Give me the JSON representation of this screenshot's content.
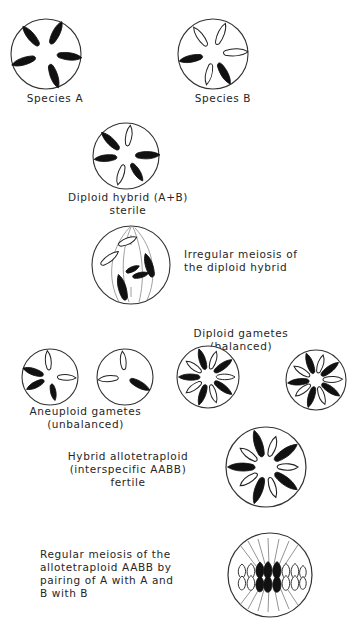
{
  "figure": {
    "title_visible": false,
    "colors": {
      "ink": "#1a1a1a",
      "outline": "#333333",
      "background": "#ffffff",
      "chromosome_dark": "#111111",
      "chromosome_light": "#ffffff"
    }
  },
  "labels": {
    "species_a": "Species A",
    "species_b": "Species B",
    "diploid_hybrid": "Diploid hybrid (A+B)\nsterile",
    "irregular_meiosis": "Irregular meiosis of\nthe diploid hybrid",
    "diploid_gametes": "Diploid gametes\n(balanced)",
    "aneuploid_gametes": "Aneuploid  gametes\n(unbalanced)",
    "hybrid_allotetraploid": "Hybrid allotetraploid\n(interspecific  AABB)\nfertile",
    "regular_meiosis": "Regular meiosis of the\nallotetraploid AABB by\npairing of  A with A and\nB with B"
  },
  "cells": {
    "species_a": {
      "name": "species-a-cell",
      "chromosome_count": 5,
      "dark_count": 5,
      "light_count": 0,
      "chromosomes": [
        {
          "angle": -108,
          "shade": "dark",
          "length": 26,
          "width": 7
        },
        {
          "angle": -40,
          "shade": "dark",
          "length": 26,
          "width": 7
        },
        {
          "angle": 26,
          "shade": "dark",
          "length": 26,
          "width": 7
        },
        {
          "angle": 96,
          "shade": "dark",
          "length": 26,
          "width": 7
        },
        {
          "angle": 160,
          "shade": "dark",
          "length": 26,
          "width": 7
        }
      ]
    },
    "species_b": {
      "name": "species-b-cell",
      "chromosome_count": 5,
      "dark_count": 2,
      "light_count": 3,
      "chromosomes": [
        {
          "angle": -102,
          "shade": "dark",
          "length": 25,
          "width": 7
        },
        {
          "angle": -36,
          "shade": "light",
          "length": 23,
          "width": 7
        },
        {
          "angle": 22,
          "shade": "light",
          "length": 23,
          "width": 7
        },
        {
          "angle": 86,
          "shade": "light",
          "length": 24,
          "width": 8
        },
        {
          "angle": 150,
          "shade": "dark",
          "length": 25,
          "width": 7
        },
        {
          "angle": 186,
          "shade": "light",
          "length": 22,
          "width": 6
        }
      ]
    },
    "diploid_hybrid": {
      "name": "diploid-hybrid-cell",
      "chromosome_count": 6,
      "dark_count": 4,
      "light_count": 2,
      "chromosomes": [
        {
          "angle": -96,
          "shade": "dark",
          "length": 24,
          "width": 7
        },
        {
          "angle": -46,
          "shade": "dark",
          "length": 26,
          "width": 7
        },
        {
          "angle": 8,
          "shade": "light",
          "length": 22,
          "width": 6
        },
        {
          "angle": 88,
          "shade": "dark",
          "length": 26,
          "width": 8
        },
        {
          "angle": 146,
          "shade": "dark",
          "length": 22,
          "width": 7
        },
        {
          "angle": 196,
          "shade": "light",
          "length": 22,
          "width": 6
        }
      ]
    },
    "irregular_meiosis": {
      "name": "irregular-meiosis-cell",
      "has_spindle": true,
      "chromosome_count": 6,
      "chromosomes": [
        {
          "x": -4,
          "y": -22,
          "angle": 70,
          "shade": "light",
          "length": 19,
          "width": 7
        },
        {
          "x": -20,
          "y": -6,
          "angle": 55,
          "shade": "light",
          "length": 21,
          "width": 7
        },
        {
          "x": 17,
          "y": 1,
          "angle": -20,
          "shade": "dark",
          "length": 24,
          "width": 8
        },
        {
          "x": 3,
          "y": 4,
          "angle": 65,
          "shade": "dark",
          "length": 14,
          "width": 6
        },
        {
          "x": 10,
          "y": 9,
          "angle": 78,
          "shade": "dark",
          "length": 16,
          "width": 7
        },
        {
          "x": -8,
          "y": 22,
          "angle": -18,
          "shade": "dark",
          "length": 26,
          "width": 8
        }
      ]
    },
    "aneuploid_gamete_1": {
      "name": "aneuploid-gamete-1",
      "chromosome_count": 4,
      "dark_count": 3,
      "light_count": 1,
      "chromosomes": [
        {
          "angle": -118,
          "shade": "dark",
          "length": 21,
          "width": 7
        },
        {
          "angle": -72,
          "shade": "dark",
          "length": 23,
          "width": 8
        },
        {
          "angle": -6,
          "shade": "light",
          "length": 21,
          "width": 7
        },
        {
          "angle": 92,
          "shade": "light",
          "length": 20,
          "width": 7
        },
        {
          "angle": 168,
          "shade": "dark",
          "length": 18,
          "width": 7
        }
      ]
    },
    "aneuploid_gamete_2": {
      "name": "aneuploid-gamete-2",
      "chromosome_count": 3,
      "dark_count": 1,
      "light_count": 2,
      "chromosomes": [
        {
          "angle": -96,
          "shade": "light",
          "length": 22,
          "width": 7
        },
        {
          "angle": -6,
          "shade": "light",
          "length": 20,
          "width": 7
        },
        {
          "angle": 120,
          "shade": "dark",
          "length": 24,
          "width": 8
        }
      ]
    },
    "diploid_gamete_1": {
      "name": "diploid-gamete-1",
      "chromosome_count": 10,
      "dark_count": 5,
      "light_count": 5,
      "chromosomes": [
        {
          "angle": -90,
          "shade": "dark",
          "length": 24,
          "width": 7
        },
        {
          "angle": -54,
          "shade": "light",
          "length": 21,
          "width": 7
        },
        {
          "angle": -18,
          "shade": "dark",
          "length": 24,
          "width": 7
        },
        {
          "angle": 18,
          "shade": "light",
          "length": 21,
          "width": 7
        },
        {
          "angle": 54,
          "shade": "dark",
          "length": 24,
          "width": 7
        },
        {
          "angle": 90,
          "shade": "light",
          "length": 21,
          "width": 7
        },
        {
          "angle": 126,
          "shade": "dark",
          "length": 24,
          "width": 7
        },
        {
          "angle": 162,
          "shade": "light",
          "length": 21,
          "width": 7
        },
        {
          "angle": 198,
          "shade": "dark",
          "length": 24,
          "width": 7
        },
        {
          "angle": 234,
          "shade": "light",
          "length": 21,
          "width": 7
        }
      ]
    },
    "diploid_gamete_2": {
      "name": "diploid-gamete-2",
      "chromosome_count": 10,
      "dark_count": 5,
      "light_count": 5,
      "chromosomes": [
        {
          "angle": -96,
          "shade": "dark",
          "length": 24,
          "width": 7
        },
        {
          "angle": -58,
          "shade": "light",
          "length": 21,
          "width": 7
        },
        {
          "angle": -20,
          "shade": "dark",
          "length": 24,
          "width": 7
        },
        {
          "angle": 16,
          "shade": "light",
          "length": 21,
          "width": 7
        },
        {
          "angle": 52,
          "shade": "dark",
          "length": 24,
          "width": 7
        },
        {
          "angle": 88,
          "shade": "light",
          "length": 21,
          "width": 7
        },
        {
          "angle": 124,
          "shade": "dark",
          "length": 24,
          "width": 7
        },
        {
          "angle": 160,
          "shade": "light",
          "length": 21,
          "width": 7
        },
        {
          "angle": 196,
          "shade": "dark",
          "length": 24,
          "width": 7
        },
        {
          "angle": 232,
          "shade": "light",
          "length": 21,
          "width": 7
        }
      ]
    },
    "allotetraploid": {
      "name": "allotetraploid-cell",
      "chromosome_count": 10,
      "dark_count": 5,
      "light_count": 5,
      "chromosomes": [
        {
          "angle": -90,
          "shade": "dark",
          "length": 27,
          "width": 9
        },
        {
          "angle": -54,
          "shade": "light",
          "length": 21,
          "width": 8
        },
        {
          "angle": -18,
          "shade": "dark",
          "length": 27,
          "width": 9
        },
        {
          "angle": 18,
          "shade": "light",
          "length": 21,
          "width": 8
        },
        {
          "angle": 54,
          "shade": "dark",
          "length": 27,
          "width": 9
        },
        {
          "angle": 90,
          "shade": "light",
          "length": 21,
          "width": 8
        },
        {
          "angle": 126,
          "shade": "dark",
          "length": 27,
          "width": 9
        },
        {
          "angle": 162,
          "shade": "light",
          "length": 21,
          "width": 8
        },
        {
          "angle": 198,
          "shade": "dark",
          "length": 27,
          "width": 9
        },
        {
          "angle": 234,
          "shade": "light",
          "length": 21,
          "width": 8
        }
      ]
    },
    "regular_meiosis": {
      "name": "regular-meiosis-cell",
      "has_spindle": true,
      "metaphase_plate": true,
      "pair_count": 10,
      "pairs": [
        {
          "x": -27,
          "shade": "light"
        },
        {
          "x": -19,
          "shade": "light"
        },
        {
          "x": -11,
          "shade": "dark"
        },
        {
          "x": -4,
          "shade": "dark"
        },
        {
          "x": 3,
          "shade": "dark"
        },
        {
          "x": 10,
          "shade": "dark"
        },
        {
          "x": 17,
          "shade": "light"
        },
        {
          "x": 24,
          "shade": "light"
        },
        {
          "x": 30,
          "shade": "light"
        }
      ]
    }
  }
}
